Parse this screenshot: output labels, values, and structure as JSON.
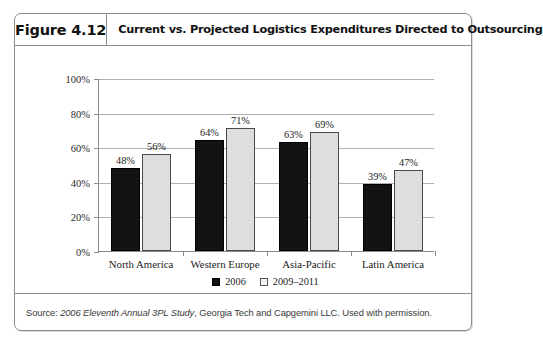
{
  "figure": {
    "number_label": "Figure 4.12",
    "title": "Current vs. Projected Logistics Expenditures Directed to Outsourcing",
    "source_prefix": "Source: ",
    "source_italic": "2006 Eleventh Annual 3PL Study",
    "source_suffix": ", Georgia Tech and Capgemini LLC. Used with permission."
  },
  "chart_data": {
    "type": "bar",
    "title": "Current vs. Projected Logistics Expenditures Directed to Outsourcing",
    "xlabel": "",
    "ylabel": "",
    "ylim": [
      0,
      100
    ],
    "ytick_labels": [
      "0%",
      "20%",
      "40%",
      "60%",
      "80%",
      "100%"
    ],
    "ytick_values": [
      0,
      20,
      40,
      60,
      80,
      100
    ],
    "grid": true,
    "legend_position": "bottom",
    "categories": [
      "North America",
      "Western Europe",
      "Asia-Pacific",
      "Latin America"
    ],
    "series": [
      {
        "name": "2006",
        "color": "#131313",
        "values": [
          48,
          64,
          63,
          39
        ],
        "labels": [
          "48%",
          "64%",
          "63%",
          "39%"
        ]
      },
      {
        "name": "2009–2011",
        "color": "#dedede",
        "values": [
          56,
          71,
          69,
          47
        ],
        "labels": [
          "56%",
          "71%",
          "69%",
          "47%"
        ]
      }
    ]
  }
}
